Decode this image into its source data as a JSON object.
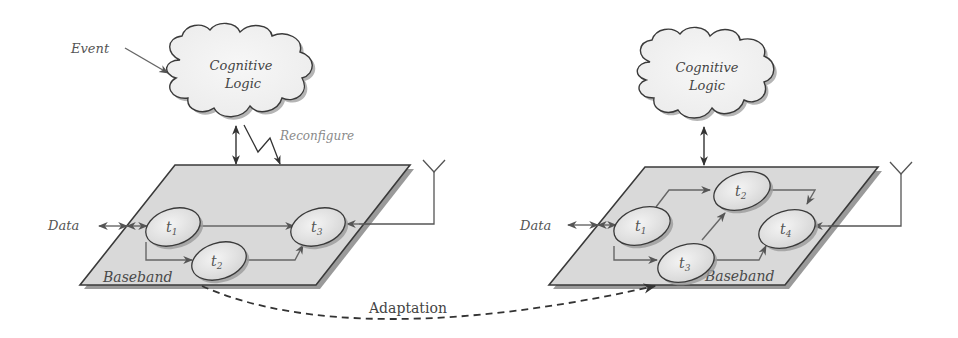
{
  "diagram": {
    "left": {
      "event_label": "Event",
      "cloud_label_line1": "Cognitive",
      "cloud_label_line2": "Logic",
      "reconfigure_label": "Reconfigure",
      "data_label": "Data",
      "baseband_label": "Baseband",
      "tasks": [
        {
          "id": "t1",
          "label": "t",
          "sub": "1"
        },
        {
          "id": "t2",
          "label": "t",
          "sub": "2"
        },
        {
          "id": "t3",
          "label": "t",
          "sub": "3"
        }
      ]
    },
    "right": {
      "cloud_label_line1": "Cognitive",
      "cloud_label_line2": "Logic",
      "data_label": "Data",
      "baseband_label": "Baseband",
      "tasks": [
        {
          "id": "t1",
          "label": "t",
          "sub": "1"
        },
        {
          "id": "t2",
          "label": "t",
          "sub": "2"
        },
        {
          "id": "t3",
          "label": "t",
          "sub": "3"
        },
        {
          "id": "t4",
          "label": "t",
          "sub": "4"
        }
      ]
    },
    "adaptation_label": "Adaptation",
    "colors": {
      "plane_fill": "#d9d9d9",
      "plane_stroke": "#3a3a3a",
      "shadow": "#9a9a9a",
      "cloud_fill": "#f2f2f2",
      "ellipse_fill": "#e4e4e4",
      "line": "#666666"
    }
  }
}
